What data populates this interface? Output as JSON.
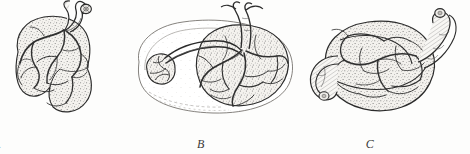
{
  "figure": {
    "background_color": "#fdfdfc",
    "ink_color": "#2b2b2b",
    "tissue_fill": "#f2f0ec",
    "vessel_color": "#303030",
    "stipple_color": "#6b6b6b",
    "panels": [
      {
        "id": "A",
        "label": "A",
        "caption": "A",
        "description": "Bilobed placenta with umbilical cord inserted at upper margin, chorionic vessels branching over stippled surface"
      },
      {
        "id": "B",
        "label": "B",
        "caption": "B",
        "description": "Placenta with succenturiate (accessory) lobe connected by vessels running across the membranes"
      },
      {
        "id": "C",
        "label": "C",
        "caption": "C",
        "description": "Rounded placenta with looped umbilical cord at left and cord stump at upper right"
      }
    ]
  }
}
